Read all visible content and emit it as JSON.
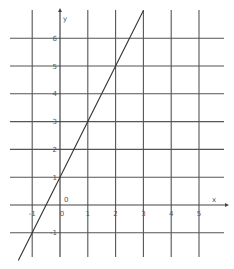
{
  "chart_data": {
    "type": "line",
    "title": "",
    "xlabel": "x",
    "ylabel": "y",
    "xlim": [
      -1,
      5
    ],
    "ylim": [
      -1,
      6
    ],
    "grid": true,
    "x_ticks": [
      "-1",
      "0",
      "1",
      "2",
      "3",
      "4",
      "5"
    ],
    "y_ticks": [
      "6",
      "5",
      "4",
      "3",
      "2",
      "1",
      "0",
      "-1"
    ],
    "origin_label": "0",
    "series": [
      {
        "name": "y = 2x + 1",
        "equation": "y = 2x + 1",
        "x": [
          -1.5,
          -1,
          0,
          1,
          2,
          3
        ],
        "y": [
          -2,
          -1,
          1,
          3,
          5,
          7
        ]
      }
    ]
  },
  "layout": {
    "origin_px": [
      60,
      205
    ],
    "unit_px": 27.8,
    "grid_color": "#555555",
    "line_color": "#333333"
  }
}
